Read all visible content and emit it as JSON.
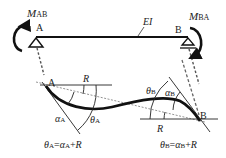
{
  "diagram": {
    "moment_A": {
      "symbol": "M",
      "subscript": "AB"
    },
    "moment_B": {
      "symbol": "M",
      "subscript": "BA"
    },
    "support_A_label": "A",
    "support_B_label": "B",
    "stiffness_label": "EI",
    "deflected": {
      "node_A": "A",
      "node_B": "B",
      "chord_rotation_A": "R",
      "chord_rotation_B": "R",
      "alpha_A": {
        "symbol": "α",
        "subscript": "A"
      },
      "theta_A": {
        "symbol": "θ",
        "subscript": "A"
      },
      "alpha_B": {
        "symbol": "α",
        "subscript": "B"
      },
      "theta_B": {
        "symbol": "θ",
        "subscript": "B"
      }
    },
    "equations": {
      "A": {
        "lhs": "θ",
        "lhs_sub": "A",
        "eq": "=",
        "a": "α",
        "a_sub": "A",
        "plus": "+",
        "r": "R"
      },
      "B": {
        "lhs": "θ",
        "lhs_sub": "B",
        "eq": "=",
        "a": "α",
        "a_sub": "B",
        "plus": "+",
        "r": "R"
      }
    },
    "colors": {
      "ink": "#111111",
      "dash": "#555555"
    }
  }
}
